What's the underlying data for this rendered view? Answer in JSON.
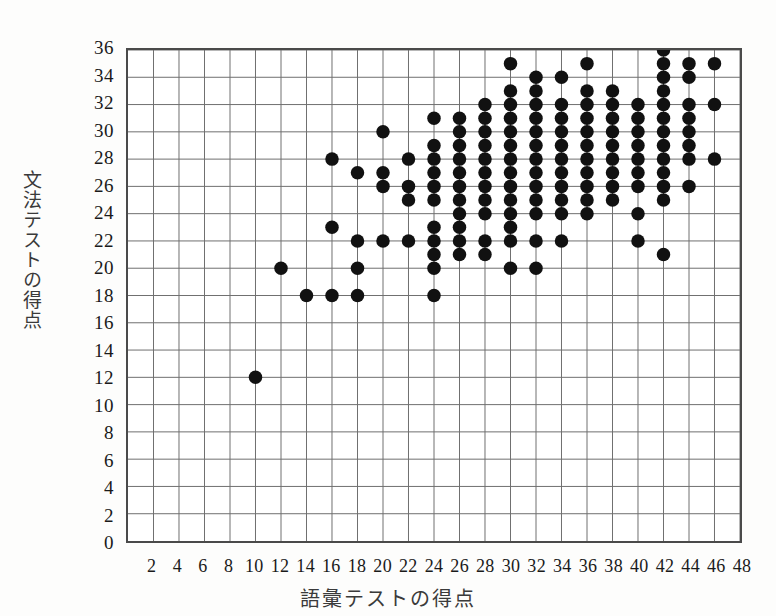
{
  "chart_data": {
    "type": "scatter",
    "title": "",
    "xlabel": "語彙テストの得点",
    "ylabel": "文法テストの得点",
    "xlim": [
      0,
      48
    ],
    "ylim": [
      0,
      36
    ],
    "x_ticks": [
      2,
      4,
      6,
      8,
      10,
      12,
      14,
      16,
      18,
      20,
      22,
      24,
      26,
      28,
      30,
      32,
      34,
      36,
      38,
      40,
      42,
      44,
      46,
      48
    ],
    "y_ticks": [
      0,
      2,
      4,
      6,
      8,
      10,
      12,
      14,
      16,
      18,
      20,
      22,
      24,
      26,
      28,
      30,
      32,
      34,
      36
    ],
    "x_tick_labels": [
      "2",
      "4",
      "6",
      "8",
      "10",
      "12",
      "14",
      "16",
      "18",
      "20",
      "22",
      "24",
      "26",
      "28",
      "30",
      "32",
      "34",
      "36",
      "38",
      "40",
      "42",
      "44",
      "46",
      "48"
    ],
    "y_tick_labels": [
      "0",
      "2",
      "4",
      "6",
      "8",
      "10",
      "12",
      "14",
      "16",
      "18",
      "20",
      "22",
      "24",
      "26",
      "28",
      "30",
      "32",
      "34",
      "36"
    ],
    "grid": true,
    "legend": "none",
    "marker": "filled-circle",
    "marker_color": "#111111",
    "marker_size": 9,
    "points": [
      [
        10,
        12
      ],
      [
        12,
        20
      ],
      [
        14,
        18
      ],
      [
        16,
        18
      ],
      [
        16,
        23
      ],
      [
        16,
        28
      ],
      [
        18,
        18
      ],
      [
        18,
        20
      ],
      [
        18,
        22
      ],
      [
        18,
        27
      ],
      [
        20,
        22
      ],
      [
        20,
        26
      ],
      [
        20,
        27
      ],
      [
        20,
        30
      ],
      [
        22,
        22
      ],
      [
        22,
        25
      ],
      [
        22,
        26
      ],
      [
        24,
        18
      ],
      [
        24,
        20
      ],
      [
        24,
        21
      ],
      [
        24,
        22
      ],
      [
        24,
        23
      ],
      [
        24,
        25
      ],
      [
        24,
        26
      ],
      [
        24,
        28
      ],
      [
        24,
        31
      ],
      [
        26,
        21
      ],
      [
        26,
        22
      ],
      [
        26,
        24
      ],
      [
        26,
        25
      ],
      [
        26,
        26
      ],
      [
        26,
        28
      ],
      [
        26,
        29
      ],
      [
        26,
        30
      ],
      [
        26,
        31
      ],
      [
        28,
        21
      ],
      [
        28,
        22
      ],
      [
        28,
        24
      ],
      [
        28,
        26
      ],
      [
        28,
        28
      ],
      [
        28,
        29
      ],
      [
        28,
        30
      ],
      [
        28,
        31
      ],
      [
        28,
        32
      ],
      [
        30,
        20
      ],
      [
        30,
        22
      ],
      [
        30,
        23
      ],
      [
        30,
        25
      ],
      [
        30,
        26
      ],
      [
        30,
        28
      ],
      [
        30,
        29
      ],
      [
        30,
        30
      ],
      [
        30,
        31
      ],
      [
        30,
        32
      ],
      [
        30,
        33
      ],
      [
        30,
        35
      ],
      [
        32,
        20
      ],
      [
        32,
        22
      ],
      [
        32,
        24
      ],
      [
        32,
        26
      ],
      [
        32,
        28
      ],
      [
        32,
        29
      ],
      [
        32,
        30
      ],
      [
        32,
        31
      ],
      [
        32,
        32
      ],
      [
        32,
        33
      ],
      [
        32,
        34
      ],
      [
        34,
        22
      ],
      [
        34,
        24
      ],
      [
        34,
        26
      ],
      [
        34,
        28
      ],
      [
        34,
        29
      ],
      [
        34,
        30
      ],
      [
        34,
        31
      ],
      [
        34,
        32
      ],
      [
        34,
        34
      ],
      [
        36,
        25
      ],
      [
        36,
        26
      ],
      [
        36,
        28
      ],
      [
        36,
        29
      ],
      [
        36,
        30
      ],
      [
        36,
        31
      ],
      [
        36,
        32
      ],
      [
        36,
        33
      ],
      [
        36,
        35
      ],
      [
        38,
        26
      ],
      [
        38,
        28
      ],
      [
        38,
        29
      ],
      [
        38,
        30
      ],
      [
        38,
        31
      ],
      [
        38,
        32
      ],
      [
        38,
        33
      ],
      [
        40,
        24
      ],
      [
        40,
        26
      ],
      [
        40,
        28
      ],
      [
        40,
        29
      ],
      [
        40,
        30
      ],
      [
        40,
        31
      ],
      [
        40,
        32
      ],
      [
        42,
        21
      ],
      [
        42,
        25
      ],
      [
        42,
        26
      ],
      [
        42,
        28
      ],
      [
        42,
        29
      ],
      [
        42,
        30
      ],
      [
        42,
        31
      ],
      [
        42,
        32
      ],
      [
        42,
        33
      ],
      [
        42,
        34
      ],
      [
        42,
        35
      ],
      [
        42,
        36
      ],
      [
        44,
        26
      ],
      [
        44,
        28
      ],
      [
        44,
        30
      ],
      [
        44,
        32
      ],
      [
        44,
        34
      ],
      [
        44,
        35
      ],
      [
        46,
        28
      ],
      [
        46,
        32
      ],
      [
        46,
        35
      ],
      [
        22,
        28
      ],
      [
        24,
        29
      ],
      [
        26,
        23
      ],
      [
        28,
        25
      ],
      [
        30,
        24
      ],
      [
        32,
        25
      ],
      [
        34,
        25
      ],
      [
        36,
        24
      ],
      [
        38,
        25
      ],
      [
        40,
        22
      ],
      [
        30,
        27
      ],
      [
        32,
        27
      ],
      [
        34,
        27
      ],
      [
        36,
        27
      ],
      [
        38,
        27
      ],
      [
        40,
        27
      ],
      [
        42,
        27
      ],
      [
        26,
        27
      ],
      [
        28,
        27
      ],
      [
        24,
        27
      ],
      [
        44,
        29
      ],
      [
        44,
        31
      ]
    ]
  }
}
